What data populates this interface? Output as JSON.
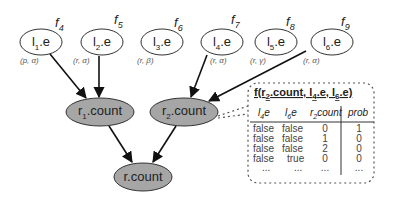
{
  "diagram": {
    "evidence_nodes": [
      {
        "id": "l1e",
        "base": "l",
        "sub": "1",
        "suffix": ".e",
        "factor_base": "f",
        "factor_sub": "4",
        "domain": "(p, α)"
      },
      {
        "id": "l2e",
        "base": "l",
        "sub": "2",
        "suffix": ".e",
        "factor_base": "f",
        "factor_sub": "5",
        "domain": "(r, α)"
      },
      {
        "id": "l3e",
        "base": "l",
        "sub": "3",
        "suffix": ".e",
        "factor_base": "f",
        "factor_sub": "6",
        "domain": "(r, β)"
      },
      {
        "id": "l4e",
        "base": "l",
        "sub": "4",
        "suffix": ".e",
        "factor_base": "f",
        "factor_sub": "7",
        "domain": "(r, α)"
      },
      {
        "id": "l5e",
        "base": "l",
        "sub": "5",
        "suffix": ".e",
        "factor_base": "f",
        "factor_sub": "8",
        "domain": "(r, γ)"
      },
      {
        "id": "l6e",
        "base": "l",
        "sub": "6",
        "suffix": ".e",
        "factor_base": "f",
        "factor_sub": "9",
        "domain": "(r, α)"
      }
    ],
    "aggregate_nodes": [
      {
        "id": "r1count",
        "base": "r",
        "sub": "1",
        "suffix": ".count"
      },
      {
        "id": "r2count",
        "base": "r",
        "sub": "2",
        "suffix": ".count"
      }
    ],
    "root_node": {
      "id": "rcount",
      "label": "r.count"
    },
    "edges": [
      {
        "from": "l1e",
        "to": "r1count"
      },
      {
        "from": "l2e",
        "to": "r1count"
      },
      {
        "from": "l4e",
        "to": "r2count"
      },
      {
        "from": "l6e",
        "to": "r2count"
      },
      {
        "from": "r1count",
        "to": "rcount"
      },
      {
        "from": "r2count",
        "to": "rcount"
      }
    ],
    "colors": {
      "evidence_fill": "#ffffff",
      "aggregate_fill": "#a6a6a6",
      "stroke": "#333333"
    }
  },
  "factor_table": {
    "title_prefix": "f(r",
    "title_sub1": "2",
    "title_mid1": ".count, l",
    "title_sub2": "4",
    "title_mid2": ".e, l",
    "title_sub3": "6",
    "title_suffix": ".e)",
    "headers": [
      {
        "base": "l",
        "sub": "4",
        "suffix": "e"
      },
      {
        "base": "l",
        "sub": "6",
        "suffix": "e"
      },
      {
        "base": "r",
        "sub": "2",
        "suffix": "count"
      },
      {
        "base": "prob",
        "sub": "",
        "suffix": ""
      }
    ],
    "rows": [
      [
        "false",
        "false",
        "0",
        "1"
      ],
      [
        "false",
        "false",
        "1",
        "0"
      ],
      [
        "false",
        "false",
        "2",
        "0"
      ],
      [
        "false",
        "true",
        "0",
        "0"
      ],
      [
        "...",
        "...",
        "...",
        "..."
      ]
    ]
  }
}
